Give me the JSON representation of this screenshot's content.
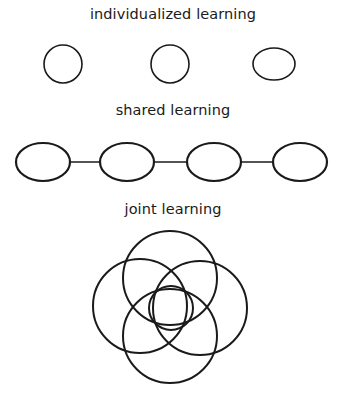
{
  "sections": [
    {
      "title": "individualized learning",
      "shapes": [
        {
          "cx": 63,
          "cy": 64,
          "rx": 19,
          "ry": 19
        },
        {
          "cx": 170,
          "cy": 64,
          "rx": 19,
          "ry": 19
        },
        {
          "cx": 274,
          "cy": 64,
          "rx": 21,
          "ry": 16
        }
      ],
      "connected": false
    },
    {
      "title": "shared learning",
      "shapes": [
        {
          "cx": 43,
          "cy": 162,
          "rx": 27,
          "ry": 19
        },
        {
          "cx": 127,
          "cy": 162,
          "rx": 27,
          "ry": 19
        },
        {
          "cx": 214,
          "cy": 162,
          "rx": 27,
          "ry": 19
        },
        {
          "cx": 300,
          "cy": 162,
          "rx": 27,
          "ry": 19
        }
      ],
      "connected": true
    },
    {
      "title": "joint learning",
      "shapes": [
        {
          "cx": 170,
          "cy": 278,
          "r": 47
        },
        {
          "cx": 140,
          "cy": 306,
          "r": 47
        },
        {
          "cx": 200,
          "cy": 308,
          "r": 47
        },
        {
          "cx": 170,
          "cy": 336,
          "r": 47
        },
        {
          "cx": 171,
          "cy": 308,
          "r": 22
        }
      ],
      "connected": false
    }
  ]
}
